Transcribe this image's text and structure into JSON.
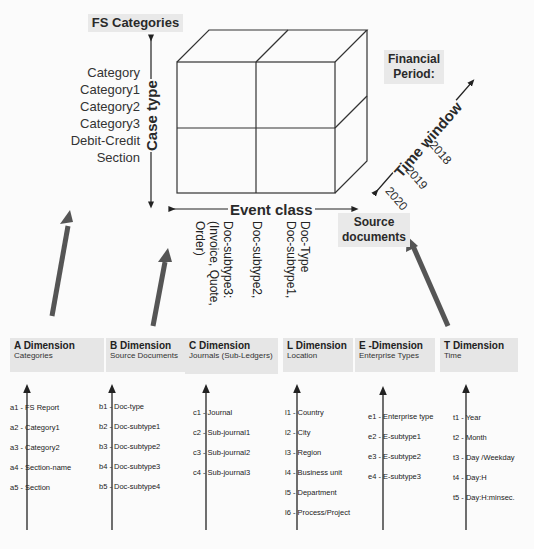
{
  "cube": {
    "top_label": "FS Categories",
    "vertical_axis_label": "Case type",
    "horizontal_axis_label": "Event class",
    "depth_axis_label": "Time window",
    "left_categories": [
      "Category",
      "Category1",
      "Category2",
      "Category3",
      "Debit-Credit",
      "Section"
    ],
    "event_class_items": [
      "Doc-Type",
      "Doc-subtype1,",
      "Doc-subtype2,",
      "Doc-subtype3:",
      "(Invoice, Quote,",
      "Order)"
    ],
    "time_years": [
      "2018",
      "2019",
      "2020"
    ],
    "financial_period_label_line1": "Financial",
    "financial_period_label_line2": "Period:",
    "source_documents_line1": "Source",
    "source_documents_line2": "documents"
  },
  "dimensions": [
    {
      "title": "A Dimension",
      "subtitle": "Categories",
      "items": [
        {
          "code": "a1",
          "label": "FS Report"
        },
        {
          "code": "a2",
          "label": "Category1"
        },
        {
          "code": "a3",
          "label": "Category2"
        },
        {
          "code": "a4",
          "label": "Section-name"
        },
        {
          "code": "a5",
          "label": "Section"
        }
      ]
    },
    {
      "title": "B Dimension",
      "subtitle": "Source Documents",
      "items": [
        {
          "code": "b1",
          "label": "Doc-type"
        },
        {
          "code": "b2",
          "label": "Doc-subtype1"
        },
        {
          "code": "b3",
          "label": "Doc-subtype2"
        },
        {
          "code": "b4",
          "label": "Doc-subtype3"
        },
        {
          "code": "b5",
          "label": "Doc-subtype4"
        }
      ]
    },
    {
      "title": "C Dimension",
      "subtitle": "Journals (Sub-Ledgers)",
      "items": [
        {
          "code": "c1",
          "label": "Journal"
        },
        {
          "code": "c2",
          "label": "Sub-journal1"
        },
        {
          "code": "c3",
          "label": "Sub-journal2"
        },
        {
          "code": "c4",
          "label": "Sub-journal3"
        }
      ]
    },
    {
      "title": "L Dimension",
      "subtitle": "Location",
      "items": [
        {
          "code": "l1",
          "label": "Country"
        },
        {
          "code": "l2",
          "label": "City"
        },
        {
          "code": "l3",
          "label": "Region"
        },
        {
          "code": "l4",
          "label": "Business unit"
        },
        {
          "code": "l5",
          "label": "Department"
        },
        {
          "code": "l6",
          "label": "Process/Project"
        }
      ]
    },
    {
      "title": "E -Dimension",
      "subtitle": "Enterprise Types",
      "items": [
        {
          "code": "e1",
          "label": "Enterprise type"
        },
        {
          "code": "e2",
          "label": "E-subtype1"
        },
        {
          "code": "e3",
          "label": "E-subtype2"
        },
        {
          "code": "e4",
          "label": "E-subtype3"
        }
      ]
    },
    {
      "title": "T Dimension",
      "subtitle": "Time",
      "items": [
        {
          "code": "t1",
          "label": "Year"
        },
        {
          "code": "t2",
          "label": "Month"
        },
        {
          "code": "t3",
          "label": "Day /Weekday"
        },
        {
          "code": "t4",
          "label": "Day:H"
        },
        {
          "code": "t5",
          "label": "Day:H:minsec."
        }
      ]
    }
  ]
}
